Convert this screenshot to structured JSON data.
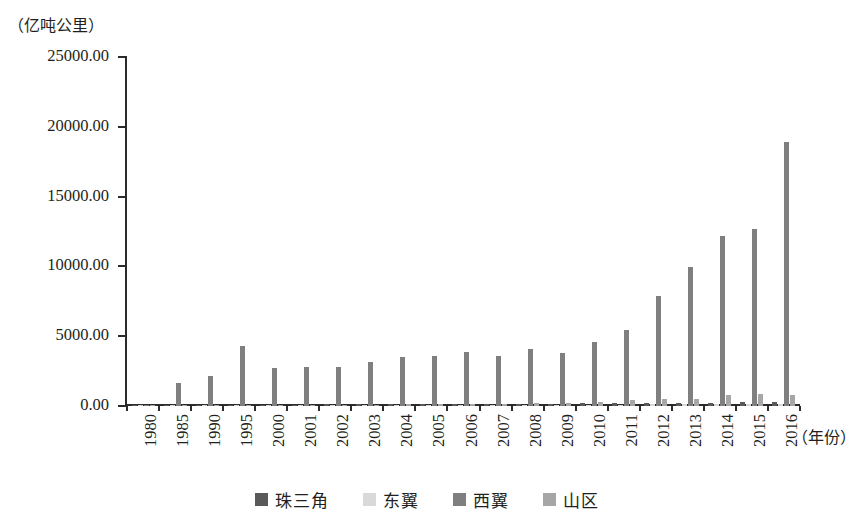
{
  "chart_data": {
    "type": "bar",
    "title": "",
    "subtitle": "",
    "ylabel": "（亿吨公里）",
    "xlabel": "（年份）",
    "ylim": [
      0,
      25000
    ],
    "ytick_labels": [
      "0.00",
      "5000.00",
      "10000.00",
      "15000.00",
      "20000.00",
      "25000.00"
    ],
    "ytick_values": [
      0,
      5000,
      10000,
      15000,
      20000,
      25000
    ],
    "grid": false,
    "legend_position": "bottom-center",
    "categories": [
      "1980",
      "1985",
      "1990",
      "1995",
      "2000",
      "2001",
      "2002",
      "2003",
      "2004",
      "2005",
      "2006",
      "2007",
      "2008",
      "2009",
      "2010",
      "2011",
      "2012",
      "2013",
      "2014",
      "2015",
      "2016"
    ],
    "series": [
      {
        "name": "珠三角",
        "color": "#595959",
        "values": [
          30,
          60,
          80,
          95,
          100,
          105,
          110,
          120,
          130,
          140,
          150,
          160,
          170,
          175,
          190,
          210,
          220,
          230,
          250,
          260,
          270
        ]
      },
      {
        "name": "东翼",
        "color": "#d9d9d9",
        "values": [
          10,
          15,
          20,
          25,
          30,
          32,
          35,
          38,
          40,
          45,
          50,
          55,
          60,
          65,
          80,
          95,
          110,
          125,
          150,
          165,
          175
        ]
      },
      {
        "name": "西翼",
        "color": "#7f7f7f",
        "values": [
          60,
          1620,
          2180,
          4330,
          2700,
          2760,
          2770,
          3170,
          3520,
          3610,
          3890,
          3560,
          4060,
          3830,
          4620,
          5450,
          7850,
          9930,
          12200,
          12700,
          18900
        ]
      },
      {
        "name": "山区",
        "color": "#a6a6a6",
        "values": [
          20,
          30,
          45,
          60,
          75,
          80,
          90,
          100,
          115,
          130,
          150,
          170,
          195,
          215,
          320,
          450,
          500,
          530,
          760,
          880,
          820
        ]
      }
    ]
  },
  "legend": {
    "items": [
      {
        "label": "珠三角",
        "color": "#595959"
      },
      {
        "label": "东翼",
        "color": "#d9d9d9"
      },
      {
        "label": "西翼",
        "color": "#7f7f7f"
      },
      {
        "label": "山区",
        "color": "#a6a6a6"
      }
    ]
  }
}
